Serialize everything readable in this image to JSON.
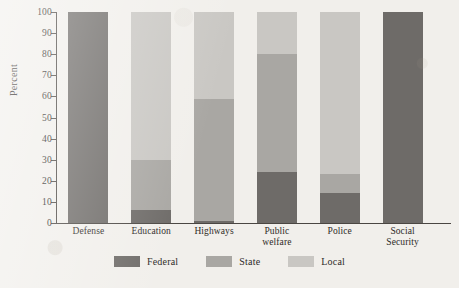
{
  "chart_data": {
    "type": "bar",
    "subtype": "stacked-100-percent",
    "title": "",
    "xlabel": "",
    "ylabel": "Percent",
    "ylim": [
      0,
      100
    ],
    "yticks": [
      0,
      10,
      20,
      30,
      40,
      50,
      60,
      70,
      80,
      90,
      100
    ],
    "grid": false,
    "legend_position": "bottom-center",
    "categories": [
      "Defense",
      "Education",
      "Highways",
      "Public welfare",
      "Police",
      "Social Security"
    ],
    "category_labels": [
      [
        "Defense"
      ],
      [
        "Education"
      ],
      [
        "Highways"
      ],
      [
        "Public",
        "welfare"
      ],
      [
        "Police"
      ],
      [
        "Social",
        "Security"
      ]
    ],
    "series": [
      {
        "name": "Federal",
        "color": "#6e6b68",
        "values": [
          100,
          6,
          1,
          24,
          14,
          100
        ]
      },
      {
        "name": "State",
        "color": "#a9a7a3",
        "values": [
          0,
          24,
          58,
          56,
          9,
          0
        ]
      },
      {
        "name": "Local",
        "color": "#c9c7c3",
        "values": [
          0,
          70,
          41,
          20,
          77,
          0
        ]
      }
    ]
  },
  "legend": {
    "items": [
      {
        "label": "Federal",
        "color": "#6e6b68"
      },
      {
        "label": "State",
        "color": "#a9a7a3"
      },
      {
        "label": "Local",
        "color": "#c9c7c3"
      }
    ]
  },
  "axis": {
    "y_title": "Percent"
  }
}
